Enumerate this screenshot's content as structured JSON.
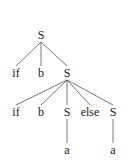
{
  "diagram": {
    "type": "parse-tree",
    "edge_color": "#555555",
    "nodes": [
      {
        "id": "n0",
        "label": "S",
        "x": 41,
        "y": 35
      },
      {
        "id": "n1",
        "label": "if",
        "x": 16,
        "y": 73
      },
      {
        "id": "n2",
        "label": "b",
        "x": 41,
        "y": 73
      },
      {
        "id": "n3",
        "label": "S",
        "x": 67,
        "y": 73
      },
      {
        "id": "n4",
        "label": "if",
        "x": 16,
        "y": 112
      },
      {
        "id": "n5",
        "label": "b",
        "x": 41,
        "y": 112
      },
      {
        "id": "n6",
        "label": "S",
        "x": 67,
        "y": 112
      },
      {
        "id": "n7",
        "label": "else",
        "x": 90,
        "y": 112
      },
      {
        "id": "n8",
        "label": "S",
        "x": 113,
        "y": 112
      },
      {
        "id": "n9",
        "label": "a",
        "x": 67,
        "y": 150
      },
      {
        "id": "n10",
        "label": "a",
        "x": 113,
        "y": 150
      }
    ],
    "edges": [
      [
        "n0",
        "n1"
      ],
      [
        "n0",
        "n2"
      ],
      [
        "n0",
        "n3"
      ],
      [
        "n3",
        "n4"
      ],
      [
        "n3",
        "n5"
      ],
      [
        "n3",
        "n6"
      ],
      [
        "n3",
        "n7"
      ],
      [
        "n3",
        "n8"
      ],
      [
        "n6",
        "n9"
      ],
      [
        "n8",
        "n10"
      ]
    ]
  }
}
